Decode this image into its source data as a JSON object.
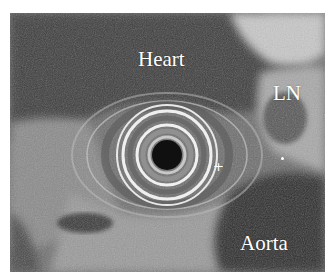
{
  "image": {
    "type": "endoscopic ultrasound",
    "labels": {
      "heart": "Heart",
      "lymph_node": "LN",
      "aorta": "Aorta"
    },
    "markers": {
      "plus": "+"
    }
  }
}
